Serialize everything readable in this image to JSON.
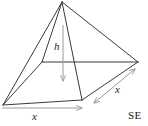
{
  "figure": {
    "type": "geometric-diagram",
    "background_color": "#ffffff",
    "edge_color": "#3a3a3a",
    "dimension_arrow_color": "#9a9a9a",
    "labels": {
      "height": "h",
      "base_edge_front": "x",
      "base_edge_side": "x"
    },
    "corner_text": "SE",
    "geometry": {
      "apex": [
        62,
        2
      ],
      "base_back_left": [
        42,
        62
      ],
      "base_back_right": [
        138,
        62
      ],
      "base_front_right": [
        82,
        100
      ],
      "base_front_left": [
        3,
        105
      ],
      "height_foot": [
        63,
        83
      ]
    },
    "dimension_arrows": [
      {
        "name": "height-arrow",
        "label": "h",
        "from": [
          63,
          25
        ],
        "to": [
          63,
          84
        ],
        "heads": "end"
      },
      {
        "name": "base-front-arrow",
        "label": "x",
        "from": [
          2,
          108
        ],
        "to": [
          86,
          108
        ],
        "heads": "end"
      },
      {
        "name": "base-side-arrow",
        "label": "x",
        "from": [
          93,
          104
        ],
        "to": [
          137,
          67
        ],
        "heads": "both"
      }
    ]
  }
}
